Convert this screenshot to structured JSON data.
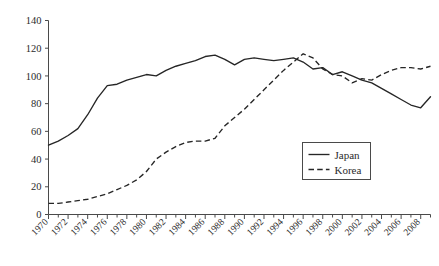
{
  "chart_data": {
    "type": "line",
    "title": "",
    "subtitle": "",
    "xlabel": "",
    "ylabel": "",
    "xlim": [
      1970,
      2009
    ],
    "ylim": [
      0,
      140
    ],
    "ytick_step": 20,
    "yticks": [
      0,
      20,
      40,
      60,
      80,
      100,
      120,
      140
    ],
    "ytick_labels": [
      "0",
      "20",
      "40",
      "60",
      "80",
      "100",
      "120",
      "140"
    ],
    "xtick_labels": [
      "1970",
      "1972",
      "1974",
      "1976",
      "1978",
      "1980",
      "1982",
      "1984",
      "1986",
      "1988",
      "1990",
      "1992",
      "1994",
      "1996",
      "1998",
      "2000",
      "2002",
      "2004",
      "2006",
      "2008"
    ],
    "xtick_values": [
      1970,
      1972,
      1974,
      1976,
      1978,
      1980,
      1982,
      1984,
      1986,
      1988,
      1990,
      1992,
      1994,
      1996,
      1998,
      2000,
      2002,
      2004,
      2006,
      2008
    ],
    "xtick_minor_values": [
      1971,
      1973,
      1975,
      1977,
      1979,
      1981,
      1983,
      1985,
      1987,
      1989,
      1991,
      1993,
      1995,
      1997,
      1999,
      2001,
      2003,
      2005,
      2007,
      2009
    ],
    "grid": false,
    "legend_position": "bottom-right",
    "x": [
      1970,
      1971,
      1972,
      1973,
      1974,
      1975,
      1976,
      1977,
      1978,
      1979,
      1980,
      1981,
      1982,
      1983,
      1984,
      1985,
      1986,
      1987,
      1988,
      1989,
      1990,
      1991,
      1992,
      1993,
      1994,
      1995,
      1996,
      1997,
      1998,
      1999,
      2000,
      2001,
      2002,
      2003,
      2004,
      2005,
      2006,
      2007,
      2008,
      2009
    ],
    "series": [
      {
        "name": "Japan",
        "style": "solid",
        "color": "#262626",
        "values": [
          50,
          53,
          57,
          62,
          72,
          84,
          93,
          94,
          97,
          99,
          101,
          100,
          104,
          107,
          109,
          111,
          114,
          115,
          112,
          108,
          112,
          113,
          112,
          111,
          112,
          113,
          110,
          105,
          106,
          101,
          103,
          100,
          97,
          95,
          91,
          87,
          83,
          79,
          77,
          85
        ]
      },
      {
        "name": "Korea",
        "style": "dashed",
        "color": "#262626",
        "values": [
          8,
          8,
          9,
          10,
          11,
          13,
          15,
          18,
          21,
          25,
          31,
          40,
          45,
          49,
          52,
          53,
          53,
          55,
          64,
          70,
          76,
          83,
          90,
          97,
          104,
          110,
          116,
          113,
          105,
          101,
          100,
          95,
          98,
          97,
          101,
          104,
          106,
          106,
          105,
          107
        ]
      }
    ]
  },
  "legend": {
    "entries": [
      {
        "label": "Japan",
        "style": "solid"
      },
      {
        "label": "Korea",
        "style": "dashed"
      }
    ]
  }
}
